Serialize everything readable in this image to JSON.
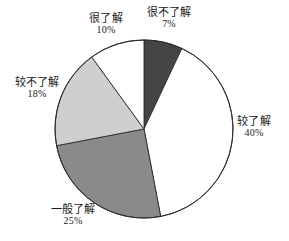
{
  "chart_data": {
    "type": "pie",
    "title": "",
    "subtitle": "",
    "xlabel": "",
    "ylabel": "",
    "legend_position": "none",
    "grid": false,
    "units": "%",
    "start_angle_deg": 0,
    "direction": "clockwise",
    "center": {
      "x": 144,
      "y": 129
    },
    "radius": 89,
    "categories": [
      "很不了解",
      "较了解",
      "一般了解",
      "较不了解",
      "很了解"
    ],
    "values": [
      7,
      40,
      25,
      18,
      10
    ],
    "slices": [
      {
        "label": "很不了解",
        "value": 7,
        "value_text": "7%",
        "color": "#454545",
        "start_deg": 0,
        "end_deg": 25.2,
        "label_position": "top-right"
      },
      {
        "label": "较了解",
        "value": 40,
        "value_text": "40%",
        "color": "#ffffff",
        "start_deg": 25.2,
        "end_deg": 169.2,
        "label_position": "right"
      },
      {
        "label": "一般了解",
        "value": 25,
        "value_text": "25%",
        "color": "#8a8a8a",
        "start_deg": 169.2,
        "end_deg": 259.2,
        "label_position": "bottom-left"
      },
      {
        "label": "较不了解",
        "value": 18,
        "value_text": "18%",
        "color": "#cfcfcf",
        "start_deg": 259.2,
        "end_deg": 324.0,
        "label_position": "left"
      },
      {
        "label": "很了解",
        "value": 10,
        "value_text": "10%",
        "color": "#ffffff",
        "start_deg": 324.0,
        "end_deg": 360.0,
        "label_position": "top-left"
      }
    ]
  },
  "style": {
    "outline_color": "#2b2b2b",
    "background": "#ffffff",
    "text_color": "#1a1a1a"
  }
}
